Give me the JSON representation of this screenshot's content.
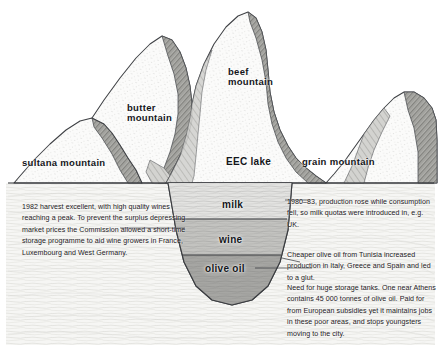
{
  "diagram": {
    "ground_line_label": "ground level",
    "colors": {
      "paper": "#ffffff",
      "ink": "#14161a",
      "pencil_light": "#e9e9e7",
      "pencil_mid": "#b9b9b5",
      "pencil_dark": "#8a8a86",
      "shadow_hatch": "#6f6f6c",
      "lake_milk": "#dedede",
      "lake_wine": "#bdbdbb",
      "lake_olive": "#9d9d9a",
      "underground": "#f3f3f1"
    }
  },
  "peaks": [
    {
      "id": "sultana",
      "label": "sultana mountain",
      "lines": [
        "sultana mountain"
      ]
    },
    {
      "id": "butter",
      "label": "butter mountain",
      "lines": [
        "butter",
        "mountain"
      ]
    },
    {
      "id": "beef",
      "label": "beef mountain",
      "lines": [
        "beef",
        "mountain"
      ]
    },
    {
      "id": "grain",
      "label": "grain mountain",
      "lines": [
        "grain mountain"
      ]
    }
  ],
  "lake": {
    "label": "EEC lake",
    "layers": [
      {
        "id": "milk",
        "label": "milk"
      },
      {
        "id": "wine",
        "label": "wine"
      },
      {
        "id": "olive",
        "label": "olive oil"
      }
    ]
  },
  "notes": {
    "wine": "1982 harvest excellent, with high quality wines reaching a peak. To prevent the surplus depressing market prices the Commission allowed a short-time storage programme to aid wine growers in France, Luxembourg and West Germany.",
    "milk": "1980–83, production rose while consumption fell, so milk quotas were introduced in, e.g. UK.",
    "olive_oil": "Cheaper olive oil from Tunisia increased production in Italy, Greece and Spain and led to a glut.",
    "storage": "Need for huge storage tanks. One near Athens contains 45 000 tonnes of olive oil. Paid for from European subsidies yet it maintains jobs in these poor areas, and stops youngsters moving to the city."
  }
}
